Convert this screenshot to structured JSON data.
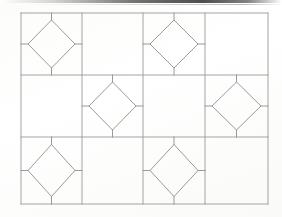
{
  "figure": {
    "background_color": "#fefefe",
    "line_color": "#9a9a9a",
    "diamond_line_color": "#8e8e8e",
    "line_width": 0.9,
    "canvas": {
      "width": 282,
      "height": 217
    }
  },
  "grid": {
    "outer": {
      "x": 21,
      "y": 13,
      "width": 247,
      "height": 191
    },
    "columns": 4,
    "rows": 3,
    "column_edges": [
      21,
      82,
      143,
      205,
      268
    ],
    "row_edges": [
      13,
      75,
      137,
      204
    ],
    "column_widths": [
      61,
      61,
      62,
      63
    ],
    "row_heights": [
      62,
      62,
      67
    ]
  },
  "diamonds": {
    "inset_ratio": 0.13,
    "cells": [
      {
        "id": "diamond-r1c1",
        "row": 0,
        "col": 0,
        "cx": 51.5,
        "cy": 44.0,
        "rx": 23.5,
        "ry": 24.0
      },
      {
        "id": "diamond-r1c3",
        "row": 0,
        "col": 2,
        "cx": 174.0,
        "cy": 44.0,
        "rx": 24.0,
        "ry": 24.0
      },
      {
        "id": "diamond-r2c2",
        "row": 1,
        "col": 1,
        "cx": 112.5,
        "cy": 106.0,
        "rx": 23.5,
        "ry": 24.0
      },
      {
        "id": "diamond-r2c4",
        "row": 1,
        "col": 3,
        "cx": 236.5,
        "cy": 106.0,
        "rx": 24.5,
        "ry": 24.0
      },
      {
        "id": "diamond-r3c1",
        "row": 2,
        "col": 0,
        "cx": 51.5,
        "cy": 170.5,
        "rx": 23.5,
        "ry": 26.0
      },
      {
        "id": "diamond-r3c3",
        "row": 2,
        "col": 2,
        "cx": 174.0,
        "cy": 170.5,
        "rx": 24.0,
        "ry": 26.0
      }
    ]
  },
  "chart_data": {
    "type": "diagram",
    "title": "",
    "categories": [
      "col-1",
      "col-2",
      "col-3",
      "col-4"
    ],
    "rows": [
      "row-1",
      "row-2",
      "row-3"
    ],
    "cell_states": [
      [
        "diamond",
        "empty",
        "diamond",
        "empty"
      ],
      [
        "empty",
        "diamond",
        "empty",
        "diamond"
      ],
      [
        "diamond",
        "empty",
        "diamond",
        "empty"
      ]
    ],
    "diamond_count": 6,
    "empty_count": 6,
    "legend": [],
    "grid": true
  }
}
